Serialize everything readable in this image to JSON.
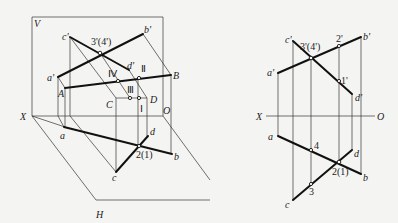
{
  "left_diagram": {
    "title": "pictorial",
    "labels": {
      "V": "V",
      "H": "H",
      "X": "X",
      "O": "O",
      "c_prime": "c'",
      "b_prime": "b'",
      "a_prime": "a'",
      "d_prime": "d'",
      "three_four_prime": "3'(4')",
      "A": "A",
      "B": "B",
      "C": "C",
      "D": "D",
      "roman_I": "Ⅰ",
      "roman_II": "Ⅱ",
      "roman_III": "Ⅲ",
      "roman_IV": "Ⅳ",
      "a": "a",
      "b": "b",
      "c": "c",
      "d": "d",
      "two_one": "2(1)"
    }
  },
  "right_diagram": {
    "title": "orthographic",
    "labels": {
      "X": "X",
      "O": "O",
      "c_prime": "c'",
      "b_prime": "b'",
      "a_prime": "a'",
      "d_prime": "d'",
      "three_four_prime": "3'(4')",
      "two_prime": "2'",
      "one_prime": "1'",
      "a": "a",
      "b": "b",
      "c": "c",
      "d": "d",
      "four": "4",
      "three": "3",
      "two_one": "2(1)"
    }
  }
}
